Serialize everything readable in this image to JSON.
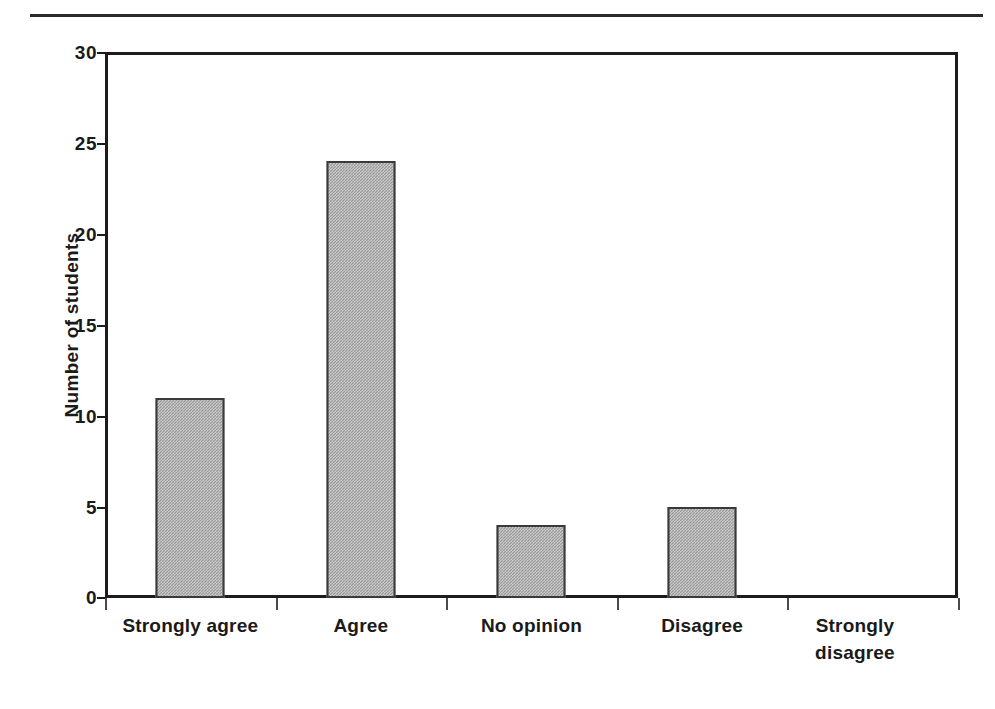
{
  "chart_data": {
    "type": "bar",
    "title": "",
    "xlabel": "",
    "ylabel": "Number of students",
    "categories": [
      "Strongly agree",
      "Agree",
      "No opinion",
      "Disagree",
      "Strongly disagree"
    ],
    "values": [
      11,
      24,
      4,
      5,
      0
    ],
    "ylim": [
      0,
      30
    ],
    "ytick_labels": [
      "30",
      "25",
      "20",
      "15",
      "10",
      "5",
      "0"
    ],
    "ytick_values": [
      30,
      25,
      20,
      15,
      10,
      5,
      0
    ],
    "ystep": 5,
    "grid": false,
    "legend": "none",
    "bar_fill_color": "#9c9c9c",
    "bar_border_color": "#3a3a3a",
    "axis_color": "#1c1c1c",
    "background_color": "#ffffff"
  },
  "figure": {
    "header_rule": "",
    "y_axis_title": "Number of students"
  }
}
